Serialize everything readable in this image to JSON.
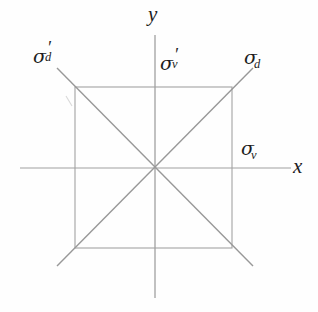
{
  "figure": {
    "kind": "geometry-diagram",
    "background_color": "#fefefe",
    "ink_color": "#8c8c8c",
    "text_color": "#1d1d1d"
  },
  "axes": {
    "x_label": "x",
    "y_label": "y",
    "origin": {
      "x": 155,
      "y": 168
    },
    "x_axis": {
      "x1": 20,
      "y1": 168,
      "x2": 291,
      "y2": 168
    },
    "y_axis": {
      "x1": 155,
      "y1": 35,
      "x2": 155,
      "y2": 298
    }
  },
  "square": {
    "left": 75,
    "top": 87,
    "right": 232,
    "bottom": 248,
    "stroke": "#9a9a9a"
  },
  "mirror_lines": [
    {
      "name": "sigma-v-horizontal",
      "label": "σ",
      "subscript": "v",
      "prime": false,
      "orientation": "horizontal",
      "coords": {
        "x1": 20,
        "y1": 168,
        "x2": 291,
        "y2": 168
      }
    },
    {
      "name": "sigma-v-prime-vertical",
      "label": "σ",
      "subscript": "v",
      "prime": true,
      "orientation": "vertical",
      "coords": {
        "x1": 155,
        "y1": 35,
        "x2": 155,
        "y2": 298
      }
    },
    {
      "name": "sigma-d-diagonal-rising",
      "label": "σ",
      "subscript": "d",
      "prime": false,
      "orientation": "diagonal-rising",
      "coords": {
        "x1": 57,
        "y1": 266,
        "x2": 253,
        "y2": 68
      }
    },
    {
      "name": "sigma-d-prime-diagonal-falling",
      "label": "σ",
      "subscript": "d",
      "prime": true,
      "orientation": "diagonal-falling",
      "coords": {
        "x1": 57,
        "y1": 68,
        "x2": 253,
        "y2": 266
      }
    }
  ],
  "labels": {
    "sigma_d_prime": {
      "sigma": "σ",
      "sub": "d",
      "prime": "′",
      "x": 33,
      "y": 44
    },
    "sigma_v_prime": {
      "sigma": "σ",
      "sub": "v",
      "prime": "′",
      "x": 160,
      "y": 51
    },
    "sigma_d": {
      "sigma": "σ",
      "sub": "d",
      "prime": "",
      "x": 244,
      "y": 48
    },
    "sigma_v": {
      "sigma": "σ",
      "sub": "v",
      "prime": "",
      "x": 241,
      "y": 139
    },
    "axis_x": {
      "text": "x",
      "x": 293,
      "y": 158
    },
    "axis_y": {
      "text": "y",
      "x": 148,
      "y": 6
    }
  }
}
